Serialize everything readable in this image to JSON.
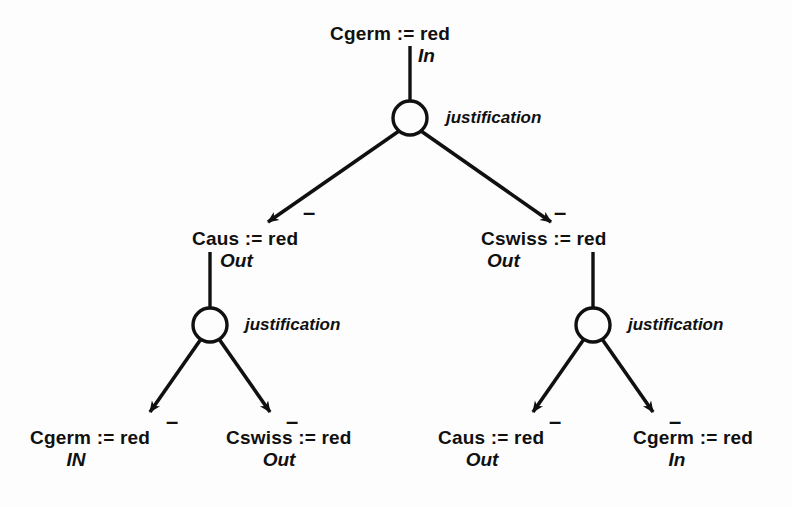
{
  "diagram": {
    "colors": {
      "ink": "#101010",
      "background": "#fdfdfd"
    },
    "justification_label": "justification",
    "sign_label": "–"
  },
  "nodes": {
    "root": {
      "name": "Cgerm := red",
      "status": "In"
    },
    "mid_left": {
      "name": "Caus := red",
      "status": "Out"
    },
    "mid_right": {
      "name": "Cswiss := red",
      "status": "Out"
    },
    "leaf_1": {
      "name": "Cgerm := red",
      "status": "IN"
    },
    "leaf_2": {
      "name": "Cswiss := red",
      "status": "Out"
    },
    "leaf_3": {
      "name": "Caus := red",
      "status": "Out"
    },
    "leaf_4": {
      "name": "Cgerm := red",
      "status": "In"
    }
  },
  "justifications": {
    "j_root": "justification",
    "j_left": "justification",
    "j_right": "justification"
  },
  "edge_signs": {
    "root_to_mid_left": "–",
    "root_to_mid_right": "–",
    "left_to_leaf_1": "–",
    "left_to_leaf_2": "–",
    "right_to_leaf_3": "–",
    "right_to_leaf_4": "–"
  }
}
